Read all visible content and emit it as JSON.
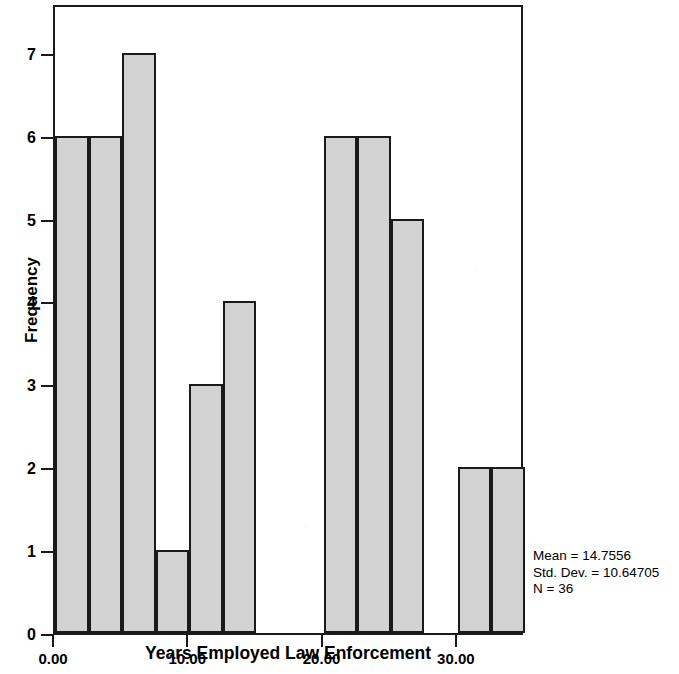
{
  "chart_data": {
    "type": "bar",
    "title": "",
    "xlabel": "Years Employed Law Enforcement",
    "ylabel": "Frequency",
    "bin_width": 2.5,
    "bin_starts": [
      0,
      2.5,
      5,
      7.5,
      10,
      12.5,
      15,
      17.5,
      20,
      22.5,
      25,
      27.5,
      30,
      32.5
    ],
    "categories": [
      "0-2.5",
      "2.5-5",
      "5-7.5",
      "7.5-10",
      "10-12.5",
      "12.5-15",
      "15-17.5",
      "17.5-20",
      "20-22.5",
      "22.5-25",
      "25-27.5",
      "27.5-30",
      "30-32.5",
      "32.5-35"
    ],
    "values": [
      6,
      6,
      7,
      1,
      3,
      4,
      0,
      0,
      6,
      6,
      5,
      0,
      2,
      2
    ],
    "x_tick_labels": [
      "0.00",
      "10.00",
      "20.00",
      "30.00"
    ],
    "x_tick_values": [
      0,
      10,
      20,
      30
    ],
    "y_tick_labels": [
      "0",
      "1",
      "2",
      "3",
      "4",
      "5",
      "6",
      "7"
    ],
    "y_tick_values": [
      0,
      1,
      2,
      3,
      4,
      5,
      6,
      7
    ],
    "xlim": [
      0,
      35
    ],
    "ylim": [
      0,
      7.6
    ],
    "grid": false,
    "legend": "none",
    "bar_fill_color": "#d2d2d2",
    "bar_edge_color": "#1a1a1a",
    "annotations": {
      "mean_line": "Mean = 14.7556",
      "std_dev_line": "Std. Dev. = 10.64705",
      "n_line": "N = 36"
    }
  },
  "axes": {
    "y_title": "Frequency",
    "x_title": "Years Employed Law Enforcement"
  },
  "stats": {
    "mean": "Mean = 14.7556",
    "std_dev": "Std. Dev. = 10.64705",
    "n": "N = 36"
  }
}
